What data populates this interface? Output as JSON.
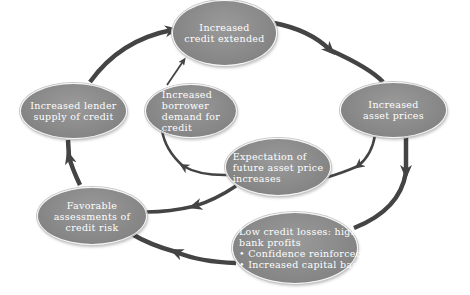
{
  "diagram": {
    "colors": {
      "node_fill": "#858585",
      "node_border": "#f4f4f4",
      "arrow": "#444444",
      "text": "#ffffff",
      "background": "#ffffff"
    },
    "nodes": [
      {
        "id": "credit-extended",
        "lines": [
          "Increased",
          "credit extended"
        ]
      },
      {
        "id": "asset-prices",
        "lines": [
          "Increased",
          "asset prices"
        ]
      },
      {
        "id": "low-credit-losses",
        "lines": [
          "Low credit losses: high",
          "bank profits",
          "• Confidence reinforced",
          "• Increased capital base"
        ]
      },
      {
        "id": "favorable-assessments",
        "lines": [
          "Favorable",
          "assessments of",
          "credit risk"
        ]
      },
      {
        "id": "lender-supply",
        "lines": [
          "Increased lender",
          "supply of credit"
        ]
      },
      {
        "id": "borrower-demand",
        "lines": [
          "Increased",
          "borrower",
          "demand for",
          "credit"
        ]
      },
      {
        "id": "expectation",
        "lines": [
          "Expectation of",
          "future asset price",
          "increases"
        ]
      }
    ],
    "edges": [
      {
        "from": "credit-extended",
        "to": "asset-prices",
        "loop": "outer"
      },
      {
        "from": "asset-prices",
        "to": "low-credit-losses",
        "loop": "outer"
      },
      {
        "from": "low-credit-losses",
        "to": "favorable-assessments",
        "loop": "outer"
      },
      {
        "from": "favorable-assessments",
        "to": "lender-supply",
        "loop": "outer"
      },
      {
        "from": "lender-supply",
        "to": "credit-extended",
        "loop": "outer"
      },
      {
        "from": "asset-prices",
        "to": "expectation",
        "loop": "inner"
      },
      {
        "from": "expectation",
        "to": "favorable-assessments",
        "loop": "inner"
      },
      {
        "from": "expectation",
        "to": "borrower-demand",
        "loop": "inner"
      },
      {
        "from": "borrower-demand",
        "to": "credit-extended",
        "loop": "inner"
      }
    ]
  }
}
